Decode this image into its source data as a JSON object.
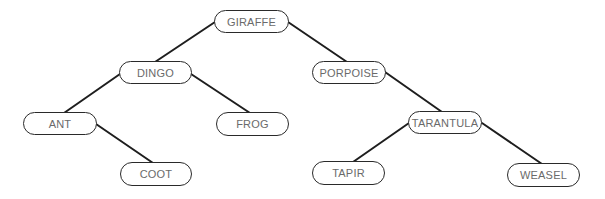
{
  "diagram": {
    "type": "binary-search-tree",
    "colors": {
      "background": "#ffffff",
      "edge": "#1e1e1e",
      "node_border": "#2a2a2a",
      "node_text": "#6a6a6a"
    },
    "nodes": [
      {
        "id": "giraffe",
        "label": "GIRAFFE",
        "x": 214,
        "y": 10,
        "w": 75,
        "h": 23
      },
      {
        "id": "dingo",
        "label": "DINGO",
        "x": 119,
        "y": 61,
        "w": 73,
        "h": 23
      },
      {
        "id": "porpoise",
        "label": "PORPOISE",
        "x": 312,
        "y": 61,
        "w": 74,
        "h": 23
      },
      {
        "id": "ant",
        "label": "ANT",
        "x": 23,
        "y": 112,
        "w": 74,
        "h": 23
      },
      {
        "id": "frog",
        "label": "FROG",
        "x": 216,
        "y": 112,
        "w": 73,
        "h": 24
      },
      {
        "id": "tarantula",
        "label": "TARANTULA",
        "x": 408,
        "y": 111,
        "w": 74,
        "h": 23
      },
      {
        "id": "coot",
        "label": "COOT",
        "x": 120,
        "y": 162,
        "w": 72,
        "h": 24
      },
      {
        "id": "tapir",
        "label": "TAPIR",
        "x": 312,
        "y": 161,
        "w": 73,
        "h": 24
      },
      {
        "id": "weasel",
        "label": "WEASEL",
        "x": 507,
        "y": 163,
        "w": 73,
        "h": 24
      }
    ],
    "edges": [
      {
        "from": "giraffe",
        "to": "dingo",
        "x1": 215,
        "y1": 22,
        "x2": 155,
        "y2": 62
      },
      {
        "from": "giraffe",
        "to": "porpoise",
        "x1": 288,
        "y1": 22,
        "x2": 347,
        "y2": 62
      },
      {
        "from": "dingo",
        "to": "ant",
        "x1": 120,
        "y1": 74,
        "x2": 64,
        "y2": 113
      },
      {
        "from": "dingo",
        "to": "frog",
        "x1": 191,
        "y1": 74,
        "x2": 250,
        "y2": 113
      },
      {
        "from": "porpoise",
        "to": "tarantula",
        "x1": 385,
        "y1": 72,
        "x2": 442,
        "y2": 112
      },
      {
        "from": "ant",
        "to": "coot",
        "x1": 96,
        "y1": 124,
        "x2": 153,
        "y2": 163
      },
      {
        "from": "tarantula",
        "to": "tapir",
        "x1": 409,
        "y1": 123,
        "x2": 353,
        "y2": 162
      },
      {
        "from": "tarantula",
        "to": "weasel",
        "x1": 482,
        "y1": 123,
        "x2": 542,
        "y2": 164
      }
    ]
  }
}
